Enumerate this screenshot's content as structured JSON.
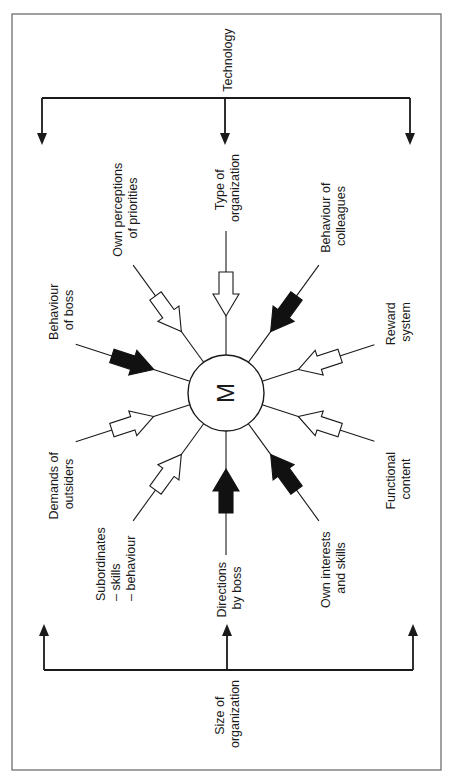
{
  "diagram": {
    "type": "radial influence diagram (rotated 90°)",
    "hub": {
      "label": "M"
    },
    "top_factor": {
      "label": "Technology",
      "arrow_direction": "toward diagram",
      "arrow_count": 3
    },
    "bottom_factor": {
      "label_lines": [
        "Size of",
        "organization"
      ],
      "arrow_direction": "toward diagram",
      "arrow_count": 3
    },
    "spokes": [
      {
        "id": "type-of-organization",
        "label_lines": [
          "Type of",
          "organization"
        ],
        "angle_deg": -90,
        "arrow_fill": "white"
      },
      {
        "id": "own-perceptions",
        "label_lines": [
          "Own perceptions",
          "of priorities"
        ],
        "angle_deg": -126,
        "arrow_fill": "white"
      },
      {
        "id": "behaviour-of-boss",
        "label_lines": [
          "Behaviour",
          "of boss"
        ],
        "angle_deg": -162,
        "arrow_fill": "black"
      },
      {
        "id": "demands-of-outsiders",
        "label_lines": [
          "Demands of",
          "outsiders"
        ],
        "angle_deg": 162,
        "arrow_fill": "white"
      },
      {
        "id": "subordinates",
        "label_lines": [
          "Subordinates",
          "– skills",
          "– behaviour"
        ],
        "angle_deg": 126,
        "arrow_fill": "white"
      },
      {
        "id": "directions-by-boss",
        "label_lines": [
          "Directions",
          "by boss"
        ],
        "angle_deg": 90,
        "arrow_fill": "black"
      },
      {
        "id": "own-interests",
        "label_lines": [
          "Own interests",
          "and skills"
        ],
        "angle_deg": 54,
        "arrow_fill": "black"
      },
      {
        "id": "functional-content",
        "label_lines": [
          "Functional",
          "content"
        ],
        "angle_deg": 18,
        "arrow_fill": "white"
      },
      {
        "id": "reward-system",
        "label_lines": [
          "Reward",
          "system"
        ],
        "angle_deg": -18,
        "arrow_fill": "white"
      },
      {
        "id": "behaviour-of-colleagues",
        "label_lines": [
          "Behaviour of",
          "colleagues"
        ],
        "angle_deg": -54,
        "arrow_fill": "black"
      }
    ],
    "colors": {
      "line": "#1a1a1a",
      "frame": "#6f6f6f",
      "background": "#ffffff",
      "black_arrow": "#111111"
    }
  }
}
